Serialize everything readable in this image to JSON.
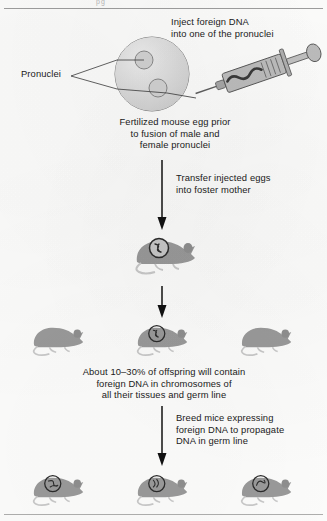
{
  "figure": {
    "title_fragment": "pg",
    "captions": {
      "inject": "Inject foreign DNA\ninto one of the pronuclei",
      "pronuclei_label": "Pronuclei",
      "egg": "Fertilized mouse egg prior\nto fusion of male and\nfemale pronuclei",
      "transfer": "Transfer injected eggs\ninto foster mother",
      "offspring": "About 10–30% of offspring will contain\nforeign DNA in chromosomes of\nall their tissues and germ line",
      "breed": "Breed mice expressing\nforeign DNA to propagate\nDNA in germ line"
    },
    "stages": [
      {
        "name": "injection",
        "objects": [
          "fertilized-egg",
          "pronucleus-upper",
          "pronucleus-lower",
          "syringe"
        ]
      },
      {
        "name": "founder",
        "mice": [
          {
            "transgenic": true
          }
        ]
      },
      {
        "name": "offspring",
        "mice": [
          {
            "transgenic": false
          },
          {
            "transgenic": true
          },
          {
            "transgenic": false
          }
        ]
      },
      {
        "name": "germline",
        "mice": [
          {
            "transgenic": true
          },
          {
            "transgenic": true
          },
          {
            "transgenic": true
          }
        ]
      }
    ],
    "arrows": [
      "transfer-arrow",
      "offspring-arrow",
      "breed-arrow"
    ],
    "colors": {
      "text": "#1a1a1a",
      "egg_fill": "#dcdcdc",
      "egg_stroke": "#7e7e7e",
      "pronucleus_fill": "#cfcfcf",
      "mouse_body": "#9a9a9a",
      "mouse_light": "#c9c9c9",
      "marker_ring": "#2b2b2b",
      "syringe_barrel": "#b5b5b5",
      "syringe_dark": "#5e5e5e",
      "arrow": "#111111",
      "rule": "#8d8d8d",
      "background": "#fdfdfc"
    }
  }
}
